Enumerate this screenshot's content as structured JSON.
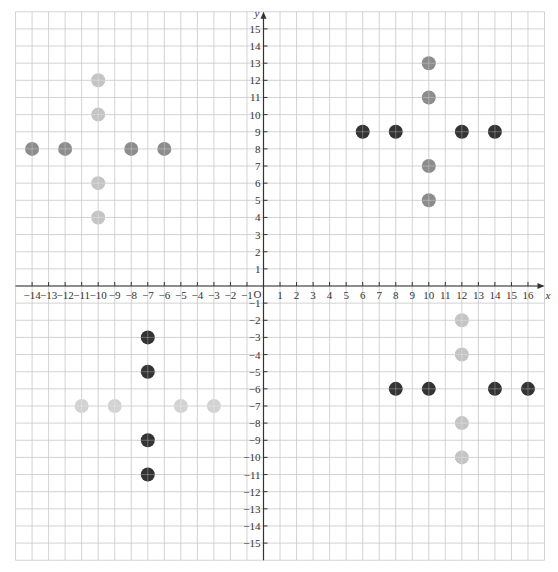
{
  "chart_data": {
    "type": "scatter",
    "title": "",
    "xlabel": "x",
    "ylabel": "y",
    "origin_label": "O",
    "xlim": [
      -15,
      17
    ],
    "ylim": [
      -16,
      16
    ],
    "grid": true,
    "legend": null,
    "x_ticks": [
      -14,
      -13,
      -12,
      -11,
      -10,
      -9,
      -8,
      -7,
      -6,
      -5,
      -4,
      -3,
      -2,
      -1,
      1,
      2,
      3,
      4,
      5,
      6,
      7,
      8,
      9,
      10,
      11,
      12,
      13,
      14,
      15,
      16
    ],
    "y_ticks": [
      -15,
      -14,
      -13,
      -12,
      -11,
      -10,
      -9,
      -8,
      -7,
      -6,
      -5,
      -4,
      -3,
      -2,
      -1,
      1,
      2,
      3,
      4,
      5,
      6,
      7,
      8,
      9,
      10,
      11,
      12,
      13,
      14,
      15
    ],
    "series": [
      {
        "name": "Q2 horizontal",
        "color": "#8c8c8c",
        "points": [
          [
            -14,
            8
          ],
          [
            -12,
            8
          ],
          [
            -8,
            8
          ],
          [
            -6,
            8
          ]
        ]
      },
      {
        "name": "Q2 vertical",
        "color": "#c4c4c4",
        "points": [
          [
            -10,
            12
          ],
          [
            -10,
            10
          ],
          [
            -10,
            6
          ],
          [
            -10,
            4
          ]
        ]
      },
      {
        "name": "Q1 horizontal",
        "color": "#333333",
        "points": [
          [
            6,
            9
          ],
          [
            8,
            9
          ],
          [
            12,
            9
          ],
          [
            14,
            9
          ]
        ]
      },
      {
        "name": "Q1 vertical",
        "color": "#8c8c8c",
        "points": [
          [
            10,
            13
          ],
          [
            10,
            11
          ],
          [
            10,
            7
          ],
          [
            10,
            5
          ]
        ]
      },
      {
        "name": "Q3 vertical",
        "color": "#333333",
        "points": [
          [
            -7,
            -3
          ],
          [
            -7,
            -5
          ],
          [
            -7,
            -9
          ],
          [
            -7,
            -11
          ]
        ]
      },
      {
        "name": "Q3 horizontal",
        "color": "#d2d2d2",
        "points": [
          [
            -11,
            -7
          ],
          [
            -9,
            -7
          ],
          [
            -5,
            -7
          ],
          [
            -3,
            -7
          ]
        ]
      },
      {
        "name": "Q4 horizontal",
        "color": "#333333",
        "points": [
          [
            8,
            -6
          ],
          [
            10,
            -6
          ],
          [
            14,
            -6
          ],
          [
            16,
            -6
          ]
        ]
      },
      {
        "name": "Q4 vertical",
        "color": "#c4c4c4",
        "points": [
          [
            12,
            -2
          ],
          [
            12,
            -4
          ],
          [
            12,
            -8
          ],
          [
            12,
            -10
          ]
        ]
      }
    ]
  },
  "layout": {
    "origin_px": [
      263.5,
      286
    ],
    "unit_x": 16.53,
    "unit_y": 17.14,
    "point_radius": 7,
    "grid_color": "#c8c8c8",
    "axis_color": "#333333"
  }
}
